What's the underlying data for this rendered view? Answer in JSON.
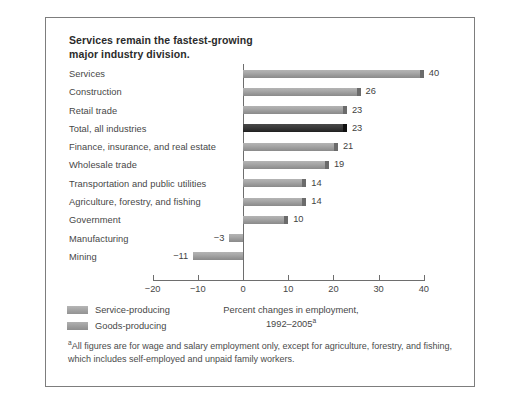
{
  "chart_data": {
    "type": "bar",
    "orientation": "horizontal",
    "title": "Services remain the fastest-growing major industry division.",
    "title_lines": [
      "Services remain the fastest-growing",
      "major industry division."
    ],
    "xlabel": "Percent changes in employment, 1992–2005",
    "xlabel_lines": [
      "Percent changes in employment,",
      "1992–2005"
    ],
    "xlabel_footnote_marker": "a",
    "ylabel": "",
    "xlim": [
      -20,
      40
    ],
    "xticks": [
      -20,
      -10,
      0,
      10,
      20,
      30,
      40
    ],
    "xticklabels": [
      "−20",
      "−10",
      "0",
      "10",
      "20",
      "30",
      "40"
    ],
    "grid": false,
    "categories": [
      "Services",
      "Construction",
      "Retail trade",
      "Total, all industries",
      "Finance, insurance, and real estate",
      "Wholesale trade",
      "Transportation and public utilities",
      "Agriculture, forestry, and fishing",
      "Government",
      "Manufacturing",
      "Mining"
    ],
    "values": [
      40,
      26,
      23,
      23,
      21,
      19,
      14,
      14,
      10,
      -3,
      -11
    ],
    "value_labels": [
      "40",
      "26",
      "23",
      "23",
      "21",
      "19",
      "14",
      "14",
      "10",
      "−3",
      "−11"
    ],
    "highlight_index": 3,
    "legend": {
      "position": "bottom-left",
      "entries": [
        {
          "label": "Service-producing",
          "color": "#a0a0a0"
        },
        {
          "label": "Goods-producing",
          "color": "#9b9b9b"
        }
      ]
    },
    "footnote": "All figures are for wage and salary employment only, except for agriculture, forestry, and fishing, which includes self-employed and unpaid family workers.",
    "footnote_marker": "a",
    "colors": {
      "bar": "#a0a0a0",
      "bar_highlight": "#2e2e2e",
      "axis": "#6e6e6e",
      "text": "#474747",
      "frame": "#7d7d7d",
      "background": "#ffffff"
    }
  },
  "rows": [
    {
      "label": "Services",
      "value": 40,
      "value_label": "40",
      "highlight": false
    },
    {
      "label": "Construction",
      "value": 26,
      "value_label": "26",
      "highlight": false
    },
    {
      "label": "Retail trade",
      "value": 23,
      "value_label": "23",
      "highlight": false
    },
    {
      "label": "Total, all industries",
      "value": 23,
      "value_label": "23",
      "highlight": true
    },
    {
      "label": "Finance, insurance, and real estate",
      "value": 21,
      "value_label": "21",
      "highlight": false
    },
    {
      "label": "Wholesale trade",
      "value": 19,
      "value_label": "19",
      "highlight": false
    },
    {
      "label": "Transportation and public utilities",
      "value": 14,
      "value_label": "14",
      "highlight": false
    },
    {
      "label": "Agriculture, forestry, and fishing",
      "value": 14,
      "value_label": "14",
      "highlight": false
    },
    {
      "label": "Government",
      "value": 10,
      "value_label": "10",
      "highlight": false
    },
    {
      "label": "Manufacturing",
      "value": -3,
      "value_label": "−3",
      "highlight": false
    },
    {
      "label": "Mining",
      "value": -11,
      "value_label": "−11",
      "highlight": false
    }
  ],
  "axis": {
    "ticks": [
      {
        "value": -20,
        "label": "−20"
      },
      {
        "value": -10,
        "label": "−10"
      },
      {
        "value": 0,
        "label": "0"
      },
      {
        "value": 10,
        "label": "10"
      },
      {
        "value": 20,
        "label": "20"
      },
      {
        "value": 30,
        "label": "30"
      },
      {
        "value": 40,
        "label": "40"
      }
    ]
  },
  "legend": {
    "items": [
      {
        "label": "Service-producing"
      },
      {
        "label": "Goods-producing"
      }
    ]
  },
  "caption": {
    "line1": "Percent changes in employment,",
    "line2": "1992–2005",
    "marker": "a"
  },
  "footnote": {
    "marker": "a",
    "text": "All figures are for wage and salary employment only, except for agriculture, forestry, and fishing, which includes self-employed and unpaid family workers."
  },
  "title": {
    "line1": "Services remain the fastest-growing",
    "line2": "major industry division."
  }
}
